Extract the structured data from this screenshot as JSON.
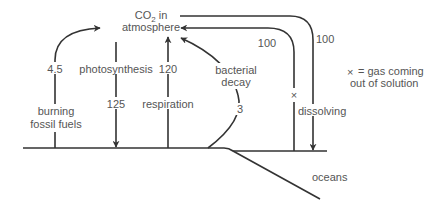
{
  "diagram": {
    "colors": {
      "line": "#333333",
      "text": "#555555",
      "background": "#ffffff"
    },
    "nodes": {
      "atmosphere": {
        "line1": "CO",
        "sub": "2",
        "line1_suffix": " in",
        "line2": "atmosphere"
      },
      "oceans": {
        "label": "oceans"
      }
    },
    "flows": [
      {
        "id": "burning",
        "label_1": "burning",
        "label_2": "fossil fuels",
        "value": "4.5",
        "direction": "to-atmosphere"
      },
      {
        "id": "photosynthesis",
        "label": "photosynthesis",
        "value": "125",
        "direction": "from-atmosphere"
      },
      {
        "id": "respiration",
        "label": "respiration",
        "value": "120",
        "direction": "to-atmosphere"
      },
      {
        "id": "bacterial-decay",
        "label_1": "bacterial",
        "label_2": "decay",
        "value": "3",
        "direction": "to-atmosphere"
      },
      {
        "id": "gas-out-of-solution",
        "value": "100",
        "marker": "×",
        "direction": "to-atmosphere"
      },
      {
        "id": "dissolving",
        "label": "dissolving",
        "value": "100",
        "direction": "from-atmosphere"
      }
    ],
    "legend": {
      "symbol": "×",
      "text_1": "= gas coming",
      "text_2": "out of solution"
    }
  }
}
